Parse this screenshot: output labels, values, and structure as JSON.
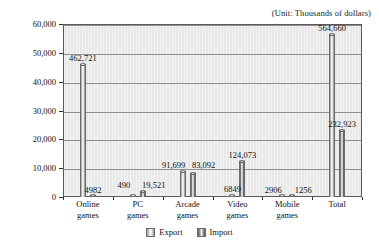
{
  "unit_caption": "(Unit: Thousands of dollars)",
  "axis": {
    "y_ticks": [
      "0",
      "10,000",
      "20,000",
      "30,000",
      "40,000",
      "50,000",
      "60,000"
    ],
    "y_min": 0,
    "y_max": 60000
  },
  "legend": {
    "items": [
      {
        "label": "Export",
        "key": "export"
      },
      {
        "label": "Import",
        "key": "import"
      }
    ]
  },
  "chart_data": {
    "type": "bar",
    "title": "",
    "subtitle": "",
    "xlabel": "",
    "ylabel": "",
    "unit_note": "(Unit: Thousands of dollars)",
    "grid": true,
    "legend_position": "bottom",
    "ylim": [
      0,
      60000
    ],
    "y_ticks": [
      0,
      10000,
      20000,
      30000,
      40000,
      50000,
      60000
    ],
    "categories": [
      "Online games",
      "PC games",
      "Arcade games",
      "Video games",
      "Mobile games",
      "Total"
    ],
    "category_lines": [
      [
        "Online",
        "games"
      ],
      [
        "PC",
        "games"
      ],
      [
        "Arcade",
        "games"
      ],
      [
        "Video",
        "games"
      ],
      [
        "Mobile",
        "games"
      ],
      [
        "Total",
        ""
      ]
    ],
    "series": [
      {
        "name": "Export",
        "values": [
          46272.1,
          49.0,
          9169.9,
          684.9,
          290.6,
          56466.0
        ],
        "labels": [
          "462,721",
          "490",
          "91,699",
          "6849",
          "2906",
          "564,660"
        ]
      },
      {
        "name": "Import",
        "values": [
          498.2,
          1952.1,
          8309.2,
          12407.3,
          125.6,
          23292.3
        ],
        "labels": [
          "4982",
          "19,521",
          "83,092",
          "124,073",
          "1256",
          "232,923"
        ]
      }
    ]
  }
}
